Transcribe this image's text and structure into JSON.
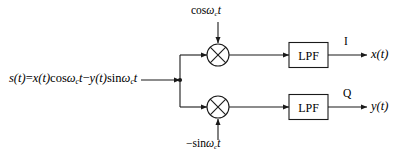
{
  "diagram": {
    "stroke_color": "#1a1a1a",
    "text_color": "#000000",
    "background_color": "#ffffff",
    "input": {
      "signal_name": "s(t)",
      "equals": "=",
      "term1_amplitude": "x(t)",
      "term1_carrier_fn": "cos",
      "term1_omega": "ω",
      "term1_subscript": "c",
      "term1_time": "t",
      "operator": "−",
      "term2_amplitude": "y(t)",
      "term2_carrier_fn": "sin",
      "term2_omega": "ω",
      "term2_subscript": "c",
      "term2_time": "t"
    },
    "carriers": {
      "top": {
        "fn": "cos",
        "omega": "ω",
        "subscript": "c",
        "time": "t"
      },
      "bottom": {
        "sign": "−",
        "fn": "sin",
        "omega": "ω",
        "subscript": "c",
        "time": "t"
      }
    },
    "filters": {
      "top_label": "LPF",
      "bottom_label": "LPF"
    },
    "branch_tags": {
      "top": "I",
      "bottom": "Q"
    },
    "outputs": {
      "top": "x(t)",
      "bottom": "y(t)"
    },
    "mixers": {
      "top_symbol": "multiplier-cross",
      "bottom_symbol": "multiplier-cross"
    }
  }
}
